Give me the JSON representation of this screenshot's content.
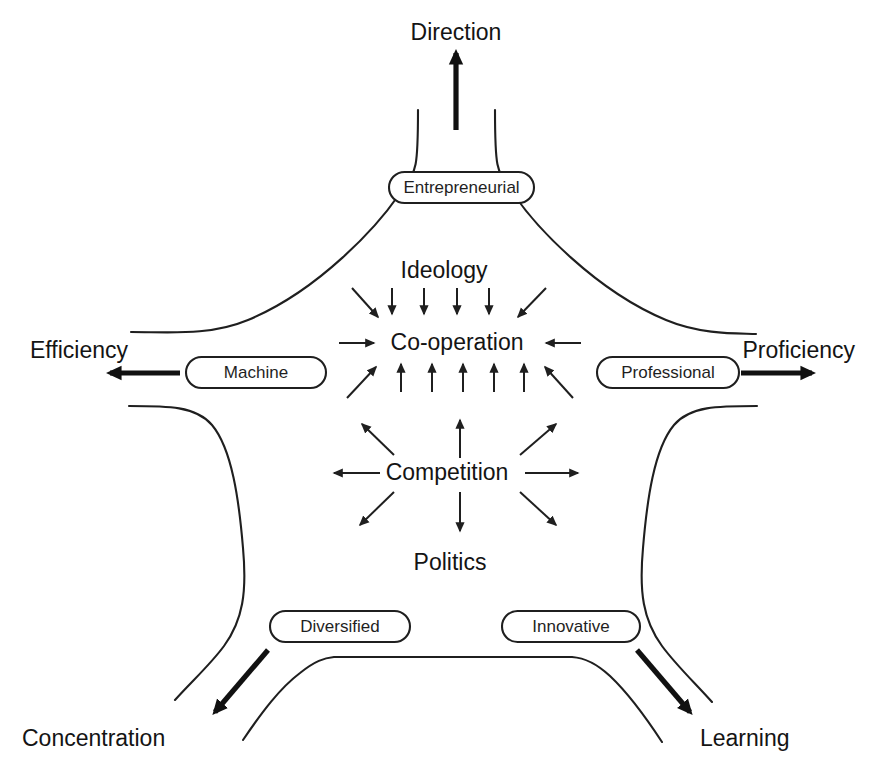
{
  "diagram": {
    "type": "pentagon-force-diagram",
    "background_color": "#ffffff",
    "stroke_color": "#1f1f1f",
    "text_color": "#141414",
    "outer_labels": {
      "top": "Direction",
      "left": "Efficiency",
      "right": "Proficiency",
      "bottom_left": "Concentration",
      "bottom_right": "Learning"
    },
    "forms": {
      "top": "Entrepreneurial",
      "left": "Machine",
      "right": "Professional",
      "bottom_left": "Diversified",
      "bottom_right": "Innovative"
    },
    "center": {
      "top_force": "Ideology",
      "inward_hub": "Co-operation",
      "outward_hub": "Competition",
      "bottom_force": "Politics"
    },
    "forces": [
      {
        "name": "Direction",
        "form": "Entrepreneurial",
        "position": "top"
      },
      {
        "name": "Efficiency",
        "form": "Machine",
        "position": "left"
      },
      {
        "name": "Proficiency",
        "form": "Professional",
        "position": "right"
      },
      {
        "name": "Concentration",
        "form": "Diversified",
        "position": "bottom-left"
      },
      {
        "name": "Learning",
        "form": "Innovative",
        "position": "bottom-right"
      }
    ],
    "catalytic_forces": [
      {
        "name": "Ideology",
        "effect": "Co-operation",
        "direction": "inward"
      },
      {
        "name": "Politics",
        "effect": "Competition",
        "direction": "outward"
      }
    ],
    "arrow_counts": {
      "ideology_down": 4,
      "ideology_diagonal": 2,
      "cooperation_horizontal": 2,
      "cooperation_up": 5,
      "cooperation_up_diagonal": 2,
      "competition_radial": 8
    }
  }
}
